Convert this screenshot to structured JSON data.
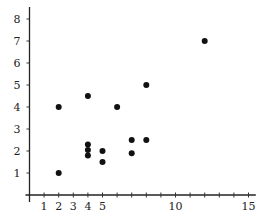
{
  "chart_data": {
    "type": "scatter",
    "title": "",
    "xlabel": "",
    "ylabel": "",
    "xlim": [
      0,
      15.5
    ],
    "ylim": [
      0,
      8.5
    ],
    "grid": false,
    "legend": null,
    "x_ticks": [
      1,
      2,
      3,
      4,
      5,
      6,
      7,
      8,
      9,
      10,
      11,
      12,
      13,
      14,
      15
    ],
    "x_tick_labels": [
      {
        "value": 1,
        "label": "1"
      },
      {
        "value": 2,
        "label": "2"
      },
      {
        "value": 3,
        "label": "3"
      },
      {
        "value": 4,
        "label": "4"
      },
      {
        "value": 5,
        "label": "5"
      },
      {
        "value": 10,
        "label": "10"
      },
      {
        "value": 15,
        "label": "15"
      }
    ],
    "y_ticks": [
      1,
      2,
      3,
      4,
      5,
      6,
      7,
      8
    ],
    "y_tick_labels": [
      {
        "value": 1,
        "label": "1"
      },
      {
        "value": 2,
        "label": "2"
      },
      {
        "value": 3,
        "label": "3"
      },
      {
        "value": 4,
        "label": "4"
      },
      {
        "value": 5,
        "label": "5"
      },
      {
        "value": 6,
        "label": "6"
      },
      {
        "value": 7,
        "label": "7"
      },
      {
        "value": 8,
        "label": "8"
      }
    ],
    "points": [
      {
        "x": 2,
        "y": 4
      },
      {
        "x": 2,
        "y": 1
      },
      {
        "x": 4,
        "y": 4.5
      },
      {
        "x": 4,
        "y": 2.3
      },
      {
        "x": 4,
        "y": 2.05
      },
      {
        "x": 4,
        "y": 1.8
      },
      {
        "x": 5,
        "y": 2
      },
      {
        "x": 5,
        "y": 1.5
      },
      {
        "x": 6,
        "y": 4
      },
      {
        "x": 7,
        "y": 2.5
      },
      {
        "x": 7,
        "y": 1.9
      },
      {
        "x": 8,
        "y": 5
      },
      {
        "x": 8,
        "y": 2.5
      },
      {
        "x": 12,
        "y": 7
      }
    ],
    "marker_color": "#111111"
  }
}
